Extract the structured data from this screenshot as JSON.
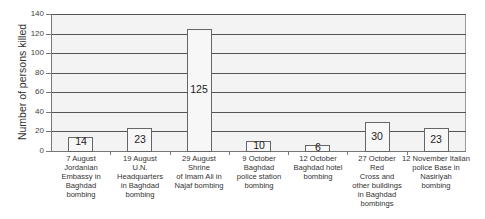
{
  "chart_data": {
    "type": "bar",
    "title": "",
    "xlabel": "",
    "ylabel": "Number of persons killed",
    "ylim": [
      0,
      140
    ],
    "yticks": [
      0,
      20,
      40,
      60,
      80,
      100,
      120,
      140
    ],
    "grid": true,
    "legend": null,
    "categories": [
      "7 August Jordanian Embassy in Baghdad bombing",
      "19 August U.N. Headquarters in Baghdad bombing",
      "29 August Shrine of Imam Ali in Najaf bombing",
      "9 October Baghdad police station bombing",
      "12 October Baghdad hotel bombing",
      "27 October Red Cross and other buildings in Baghdad bombings",
      "12 November Italian police Base in Nasiriyah bombing"
    ],
    "category_label_lines": [
      [
        "7 August",
        "Jordanian",
        "Embassy in",
        "Baghdad",
        "bombing"
      ],
      [
        "19 August",
        "U.N.",
        "Headquarters",
        "in Baghdad",
        "bombing"
      ],
      [
        "29 August",
        "Shrine",
        "of Imam Ali in",
        "Najaf bombing"
      ],
      [
        "9 October",
        "Baghdad",
        "police station",
        "bombing"
      ],
      [
        "12 October",
        "Baghdad hotel",
        "bombing"
      ],
      [
        "27 October",
        "Red",
        "Cross and",
        "other buildings",
        "in Baghdad",
        "bombings"
      ],
      [
        "12 November Italian",
        "police Base in",
        "Nasiriyah",
        "bombing"
      ]
    ],
    "values": [
      14,
      23,
      125,
      10,
      6,
      30,
      23
    ],
    "value_labels": [
      "14",
      "23",
      "125",
      "10",
      "6",
      "30",
      "23"
    ]
  },
  "colors": {
    "plot_background": "#f3f3f3",
    "bar_fill": "#f7f7f7",
    "bar_border": "#666666",
    "gridline": "#555555"
  }
}
